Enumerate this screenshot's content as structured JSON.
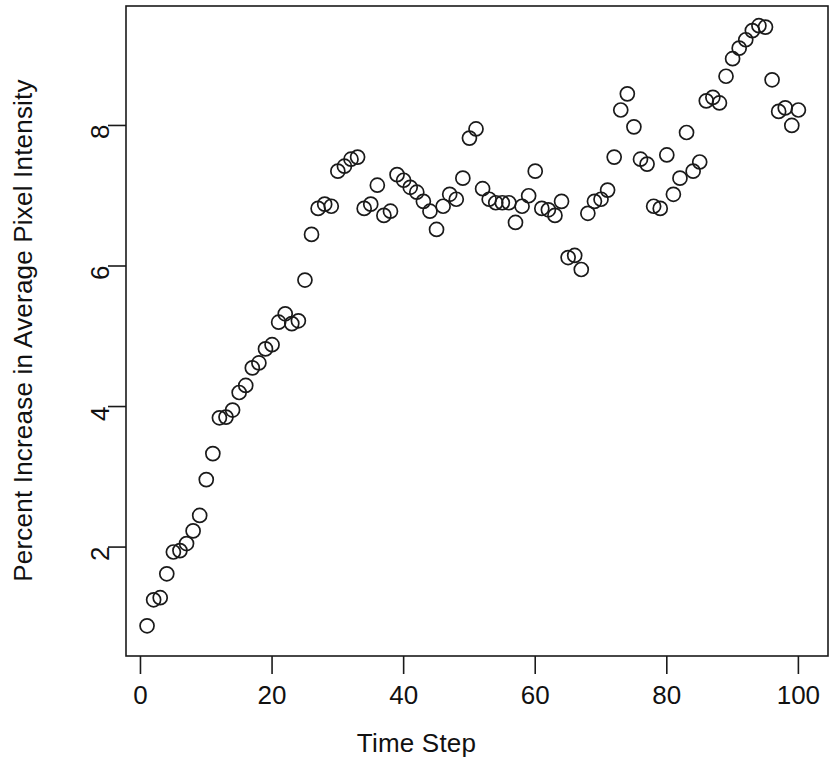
{
  "figure": {
    "background_color": "#ffffff",
    "ink_color": "#1a1a1a",
    "plot_box": {
      "left": 126,
      "top": 6,
      "right": 828,
      "bottom": 656
    }
  },
  "axes": {
    "x": {
      "label": "Time Step",
      "ticks": [
        0,
        20,
        40,
        60,
        80,
        100
      ],
      "tick_labels": [
        "0",
        "20",
        "40",
        "60",
        "80",
        "100"
      ],
      "range": [
        -2.2,
        104.5
      ]
    },
    "y": {
      "label": "Percent Increase in Average Pixel Intensity",
      "ticks": [
        2,
        4,
        6,
        8
      ],
      "tick_labels": [
        "2",
        "4",
        "6",
        "8"
      ],
      "range": [
        0.45,
        9.7
      ]
    }
  },
  "marker": {
    "shape": "open-circle",
    "radius_px": 7,
    "stroke_width_px": 1.7,
    "stroke_color": "#1a1a1a",
    "fill": "none"
  },
  "chart_data": {
    "type": "scatter",
    "title": "",
    "xlabel": "Time Step",
    "ylabel": "Percent Increase in Average Pixel Intensity",
    "xlim": [
      -2.2,
      104.5
    ],
    "ylim": [
      0.45,
      9.7
    ],
    "grid": false,
    "legend": null,
    "series": [
      {
        "name": "Percent increase in average pixel intensity",
        "x": [
          1,
          2,
          3,
          4,
          5,
          6,
          7,
          8,
          9,
          10,
          11,
          12,
          13,
          14,
          15,
          16,
          17,
          18,
          19,
          20,
          21,
          22,
          23,
          24,
          25,
          26,
          27,
          28,
          29,
          30,
          31,
          32,
          33,
          34,
          35,
          36,
          37,
          38,
          39,
          40,
          41,
          42,
          43,
          44,
          45,
          46,
          47,
          48,
          49,
          50,
          51,
          52,
          53,
          54,
          55,
          56,
          57,
          58,
          59,
          60,
          61,
          62,
          63,
          64,
          65,
          66,
          67,
          68,
          69,
          70,
          71,
          72,
          73,
          74,
          75,
          76,
          77,
          78,
          79,
          80,
          81,
          82,
          83,
          84,
          85,
          86,
          87,
          88,
          89,
          90,
          91,
          92,
          93,
          94,
          95,
          96,
          97,
          98,
          99,
          100
        ],
        "y": [
          0.88,
          1.25,
          1.28,
          1.62,
          1.93,
          1.95,
          2.05,
          2.23,
          2.45,
          2.96,
          3.33,
          3.84,
          3.85,
          3.95,
          4.2,
          4.3,
          4.55,
          4.62,
          4.82,
          4.88,
          5.2,
          5.32,
          5.18,
          5.22,
          5.8,
          6.45,
          6.82,
          6.88,
          6.85,
          7.35,
          7.42,
          7.52,
          7.55,
          6.82,
          6.88,
          7.15,
          6.72,
          6.78,
          7.3,
          7.22,
          7.12,
          7.05,
          6.92,
          6.78,
          6.52,
          6.85,
          7.02,
          6.95,
          7.25,
          7.82,
          7.95,
          7.1,
          6.95,
          6.9,
          6.9,
          6.9,
          6.62,
          6.85,
          7.0,
          7.35,
          6.82,
          6.8,
          6.72,
          6.92,
          6.12,
          6.15,
          5.95,
          6.75,
          6.92,
          6.95,
          7.08,
          7.55,
          8.22,
          8.45,
          7.98,
          7.52,
          7.45,
          6.85,
          6.82,
          7.58,
          7.02,
          7.25,
          7.9,
          7.35,
          7.48,
          8.35,
          8.4,
          8.32,
          8.7,
          8.95,
          9.1,
          9.22,
          9.35,
          9.42,
          9.4,
          8.65,
          8.2,
          8.25,
          8.0,
          8.22
        ]
      }
    ]
  }
}
